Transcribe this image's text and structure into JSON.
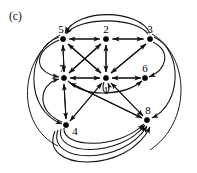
{
  "figure": {
    "panel_label": "(c)",
    "type": "directed-graph",
    "background_color": "#ffffff",
    "stroke_color": "#111111",
    "node_color": "#000000",
    "width": 197,
    "height": 173
  },
  "graph": {
    "directed": true,
    "node_count": 8,
    "nodes": [
      {
        "id": "1",
        "label": "1",
        "x": 106,
        "y": 78,
        "label_dx": 0,
        "label_dy": 13
      },
      {
        "id": "2",
        "label": "2",
        "x": 106,
        "y": 39,
        "label_dx": 0,
        "label_dy": -9
      },
      {
        "id": "3",
        "label": "3",
        "x": 150,
        "y": 39,
        "label_dx": 0,
        "label_dy": -9
      },
      {
        "id": "4",
        "label": "4",
        "x": 66,
        "y": 125,
        "label_dx": 9,
        "label_dy": 7
      },
      {
        "id": "5",
        "label": "5",
        "x": 63,
        "y": 39,
        "label_dx": -2,
        "label_dy": -9
      },
      {
        "id": "6",
        "label": "6",
        "x": 145,
        "y": 78,
        "label_dx": 0,
        "label_dy": -9
      },
      {
        "id": "7",
        "label": "7",
        "x": 64,
        "y": 78,
        "label_dx": -2,
        "label_dy": -9
      },
      {
        "id": "8",
        "label": "8",
        "x": 147,
        "y": 120,
        "label_dx": 1,
        "label_dy": -9
      }
    ],
    "straight_edges": [
      {
        "from": "2",
        "to": "5",
        "bidirectional": true,
        "note": "top row left segment"
      },
      {
        "from": "2",
        "to": "3",
        "bidirectional": true,
        "note": "top row right segment"
      },
      {
        "from": "5",
        "to": "7",
        "bidirectional": true,
        "note": "left column"
      },
      {
        "from": "7",
        "to": "4",
        "bidirectional": true,
        "note": "left column lower"
      },
      {
        "from": "2",
        "to": "1",
        "bidirectional": true,
        "note": "center vertical"
      },
      {
        "from": "7",
        "to": "1",
        "bidirectional": true,
        "note": "middle row left"
      },
      {
        "from": "1",
        "to": "6",
        "bidirectional": true,
        "note": "middle row right"
      },
      {
        "from": "5",
        "to": "1",
        "bidirectional": true,
        "note": "diagonal NW-SE"
      },
      {
        "from": "7",
        "to": "2",
        "bidirectional": true,
        "note": "diagonal SW-NE"
      },
      {
        "from": "3",
        "to": "1",
        "bidirectional": true,
        "note": "diagonal NE-SW"
      },
      {
        "from": "4",
        "to": "1",
        "bidirectional": true,
        "note": "diagonal SW-NE lower"
      },
      {
        "from": "1",
        "to": "8",
        "bidirectional": true,
        "note": "diagonal center to 8"
      },
      {
        "from": "7",
        "to": "8",
        "bidirectional": true,
        "note": "long diagonal 7 to 8"
      }
    ],
    "self_loops": [
      {
        "at": "1",
        "direction": "down",
        "note": "narrow vertical loop below node 1"
      }
    ],
    "curved_edges": [
      {
        "from": "3",
        "to": "5",
        "arc": "over-top-outer",
        "note": "large arc above row"
      },
      {
        "from": "3",
        "to": "5",
        "arc": "over-top-inner",
        "note": "smaller arc above row"
      },
      {
        "from": "5",
        "to": "4",
        "arc": "left-outer",
        "note": "left bulge"
      },
      {
        "from": "5",
        "to": "7",
        "arc": "left-mid",
        "note": "left bulge"
      },
      {
        "from": "4",
        "to": "7",
        "arc": "left-inner",
        "note": "left bulge"
      },
      {
        "from": "7",
        "to": "6",
        "arc": "under-center",
        "note": "passes below node 1"
      },
      {
        "from": "3",
        "to": "8",
        "arc": "right-outer",
        "note": "right bulge"
      },
      {
        "from": "3",
        "to": "6",
        "arc": "right-inner",
        "note": "right bulge"
      },
      {
        "from": "4",
        "to": "8",
        "arc": "bottom-1",
        "note": "bottom sweep"
      },
      {
        "from": "4",
        "to": "8",
        "arc": "bottom-2",
        "note": "bottom sweep"
      },
      {
        "from": "4",
        "to": "8",
        "arc": "bottom-3",
        "note": "bottom sweep"
      },
      {
        "from": "4",
        "to": "8",
        "arc": "bottom-4",
        "note": "bottom sweep outermost"
      }
    ]
  }
}
